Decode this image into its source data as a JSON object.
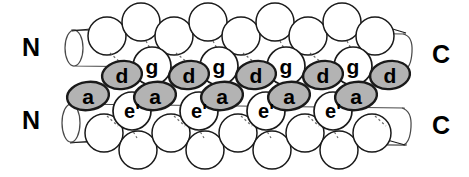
{
  "figure": {
    "type": "molecular-structure-diagram",
    "background_color": "#ffffff",
    "outline_color": "#000000",
    "shaded_fill": "#b3b3b3",
    "unshaded_fill": "#ffffff",
    "helix_fill": "#ffffff",
    "connector_style": "dashed"
  },
  "terminus_labels": {
    "top_left": "N",
    "bottom_left": "N",
    "top_right": "C",
    "bottom_right": "C"
  },
  "helices": [
    {
      "name": "upper-helix",
      "n_terminus": "N",
      "c_terminus": "C"
    },
    {
      "name": "lower-helix",
      "n_terminus": "N",
      "c_terminus": "C"
    }
  ],
  "residues": {
    "shaded_positions": [
      "a",
      "d"
    ],
    "unshaded_positions": [
      "g",
      "e'"
    ],
    "row_g": [
      "g",
      "g",
      "g",
      "g"
    ],
    "row_d": [
      "d",
      "d",
      "d",
      "d",
      "d"
    ],
    "row_a": [
      "a",
      "a",
      "a",
      "a",
      "a"
    ],
    "row_e": [
      "e'",
      "e'",
      "e'",
      "e'"
    ]
  },
  "geometry": {
    "shaded_ellipses": [
      {
        "label": "a",
        "cx": 88,
        "cy": 96,
        "rx": 21,
        "ry": 14,
        "rot": -8
      },
      {
        "label": "a",
        "cx": 155,
        "cy": 96,
        "rx": 21,
        "ry": 14,
        "rot": -8
      },
      {
        "label": "a",
        "cx": 222,
        "cy": 96,
        "rx": 21,
        "ry": 14,
        "rot": -8
      },
      {
        "label": "a",
        "cx": 289,
        "cy": 96,
        "rx": 21,
        "ry": 14,
        "rot": -8
      },
      {
        "label": "a",
        "cx": 356,
        "cy": 96,
        "rx": 21,
        "ry": 14,
        "rot": -8
      },
      {
        "label": "d",
        "cx": 122,
        "cy": 75,
        "rx": 20,
        "ry": 14,
        "rot": -8
      },
      {
        "label": "d",
        "cx": 189,
        "cy": 75,
        "rx": 20,
        "ry": 14,
        "rot": -8
      },
      {
        "label": "d",
        "cx": 256,
        "cy": 75,
        "rx": 20,
        "ry": 14,
        "rot": -8
      },
      {
        "label": "d",
        "cx": 323,
        "cy": 75,
        "rx": 20,
        "ry": 14,
        "rot": -8
      },
      {
        "label": "d",
        "cx": 390,
        "cy": 75,
        "rx": 20,
        "ry": 14,
        "rot": -8
      }
    ],
    "open_circles_labeled": [
      {
        "label": "g",
        "cx": 152,
        "cy": 66,
        "r": 19
      },
      {
        "label": "g",
        "cx": 219,
        "cy": 66,
        "r": 19
      },
      {
        "label": "g",
        "cx": 286,
        "cy": 66,
        "r": 19
      },
      {
        "label": "g",
        "cx": 353,
        "cy": 66,
        "r": 19
      },
      {
        "label": "e'",
        "cx": 132,
        "cy": 111,
        "r": 19
      },
      {
        "label": "e'",
        "cx": 199,
        "cy": 111,
        "r": 19
      },
      {
        "label": "e'",
        "cx": 266,
        "cy": 111,
        "r": 19
      },
      {
        "label": "e'",
        "cx": 333,
        "cy": 111,
        "r": 19
      }
    ]
  }
}
